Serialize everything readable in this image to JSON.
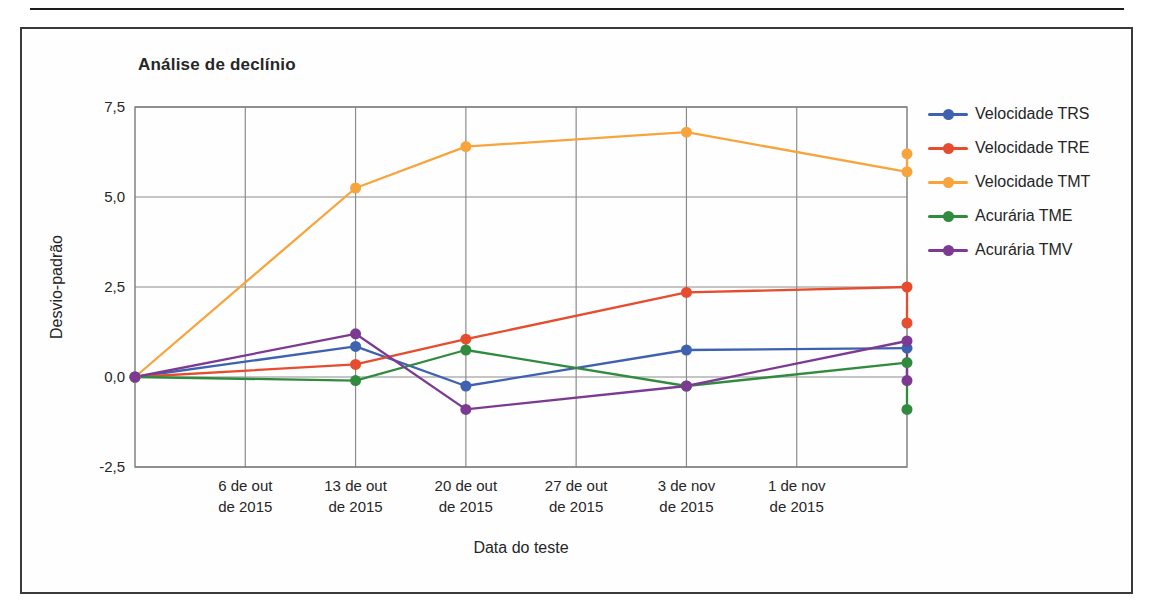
{
  "chart_data": {
    "type": "line",
    "title": "Análise de declínio",
    "x_axis": {
      "title": "Data do teste",
      "tick_labels": [
        "6 de out\nde 2015",
        "13 de out\nde 2015",
        "20 de out\nde 2015",
        "27 de out\nde 2015",
        "3 de nov\nde 2015",
        "1 de nov\nde 2015"
      ],
      "slot_count": 7,
      "gridline_slots": [
        1,
        2,
        3,
        4,
        5,
        6
      ]
    },
    "y_axis": {
      "title": "Desvio-padrão",
      "tick_labels": [
        "7,5",
        "5,0",
        "2,5",
        "0,0",
        "-2,5"
      ],
      "tick_values": [
        7.5,
        5.0,
        2.5,
        0.0,
        -2.5
      ],
      "min": -2.5,
      "max": 7.5,
      "gridline_values": [
        7.5,
        5.0,
        2.5,
        0.0,
        -2.5
      ]
    },
    "series": [
      {
        "name": "Velocidade TRS",
        "color": "#3E61B0",
        "x_slots": [
          0,
          2,
          3,
          5,
          7
        ],
        "values": [
          0,
          0.85,
          -0.25,
          0.75,
          0.8
        ],
        "extra_end_value": null
      },
      {
        "name": "Velocidade TRE",
        "color": "#E74C2E",
        "x_slots": [
          0,
          2,
          3,
          5,
          7
        ],
        "values": [
          0,
          0.35,
          1.05,
          2.35,
          2.5
        ],
        "extra_end_value": 1.5
      },
      {
        "name": "Velocidade TMT",
        "color": "#F7A43D",
        "x_slots": [
          0,
          2,
          3,
          5,
          7
        ],
        "values": [
          0,
          5.25,
          6.4,
          6.8,
          5.7
        ],
        "extra_end_value": 6.2
      },
      {
        "name": "Acurária TME",
        "color": "#318B3F",
        "x_slots": [
          0,
          2,
          3,
          5,
          7
        ],
        "values": [
          0,
          -0.1,
          0.75,
          -0.25,
          0.4
        ],
        "extra_end_value": -0.9
      },
      {
        "name": "Acurária TMV",
        "color": "#7C3A92",
        "x_slots": [
          0,
          2,
          3,
          5,
          7
        ],
        "values": [
          0,
          1.2,
          -0.9,
          -0.25,
          1.0
        ],
        "extra_end_value": -0.1
      }
    ],
    "legend_position": "right",
    "grid": "on",
    "style": {
      "grid_color": "#8c8c8c",
      "plot_border_color": "#7a7a7a",
      "marker_radius": 5.5,
      "line_width": 2.3
    }
  }
}
